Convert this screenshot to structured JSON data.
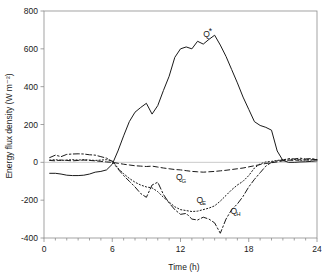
{
  "chart_data": {
    "type": "line",
    "title": "",
    "xlabel": "Time (h)",
    "ylabel": "Energy flux density (W m⁻²)",
    "xlim": [
      0,
      24
    ],
    "ylim": [
      -400,
      800
    ],
    "xticks": [
      0,
      6,
      12,
      18,
      24
    ],
    "yticks": [
      -400,
      -200,
      0,
      200,
      400,
      600,
      800
    ],
    "xtick_labels": [
      "0",
      "6",
      "12",
      "18",
      "24"
    ],
    "ytick_labels": [
      "-400",
      "-200",
      "0",
      "200",
      "400",
      "600",
      "800"
    ],
    "minor_xtick_interval": 1,
    "grid": false,
    "legend_position": "inline-annotations",
    "x": [
      0.5,
      1,
      1.5,
      2,
      2.5,
      3,
      3.5,
      4,
      4.5,
      5,
      5.5,
      6,
      6.5,
      7,
      7.5,
      8,
      8.5,
      9,
      9.5,
      10,
      10.5,
      11,
      11.5,
      12,
      12.5,
      13,
      13.5,
      14,
      14.5,
      15,
      15.5,
      16,
      16.5,
      17,
      17.5,
      18,
      18.5,
      19,
      19.5,
      20,
      20.5,
      21,
      21.5,
      22,
      22.5,
      23,
      23.5,
      24
    ],
    "series": [
      {
        "name": "Q*",
        "label": "Q*",
        "label_base": "Q",
        "label_sub": "*",
        "linestyle": "solid",
        "color": "#1a1a1a",
        "values": [
          -58,
          -58,
          -62,
          -68,
          -70,
          -70,
          -68,
          -62,
          -52,
          -48,
          -40,
          -10,
          60,
          140,
          215,
          265,
          290,
          312,
          255,
          300,
          380,
          455,
          555,
          600,
          610,
          600,
          640,
          625,
          650,
          672,
          620,
          560,
          490,
          420,
          345,
          280,
          215,
          195,
          185,
          170,
          60,
          10,
          0,
          0,
          2,
          3,
          5,
          8
        ]
      },
      {
        "name": "QG",
        "label": "QG",
        "label_base": "Q",
        "label_sub": "G",
        "linestyle": "dashed",
        "color": "#1a1a1a",
        "values": [
          10,
          8,
          12,
          10,
          8,
          10,
          12,
          10,
          8,
          5,
          2,
          0,
          -5,
          -10,
          -14,
          -18,
          -20,
          -22,
          -20,
          -25,
          -30,
          -34,
          -38,
          -40,
          -44,
          -48,
          -50,
          -52,
          -50,
          -48,
          -45,
          -42,
          -38,
          -34,
          -30,
          -24,
          -18,
          -12,
          -6,
          -2,
          2,
          8,
          12,
          10,
          14,
          12,
          14,
          15
        ]
      },
      {
        "name": "QE",
        "label": "QE",
        "label_base": "Q",
        "label_sub": "E",
        "linestyle": "dotted",
        "color": "#1a1a1a",
        "values": [
          12,
          14,
          10,
          12,
          14,
          12,
          14,
          12,
          10,
          12,
          14,
          8,
          -30,
          -60,
          -85,
          -105,
          -120,
          -130,
          -135,
          -155,
          -185,
          -210,
          -235,
          -250,
          -255,
          -260,
          -258,
          -250,
          -242,
          -230,
          -205,
          -175,
          -145,
          -120,
          -100,
          -70,
          -30,
          -8,
          2,
          5,
          10,
          14,
          12,
          16,
          10,
          14,
          12,
          14
        ]
      },
      {
        "name": "QH",
        "label": "QH",
        "label_base": "Q",
        "label_sub": "H",
        "linestyle": "dashdot",
        "color": "#1a1a1a",
        "values": [
          25,
          38,
          30,
          42,
          44,
          45,
          44,
          40,
          38,
          30,
          22,
          5,
          -35,
          -70,
          -100,
          -130,
          -165,
          -185,
          -120,
          -105,
          -170,
          -215,
          -250,
          -275,
          -270,
          -300,
          -305,
          -290,
          -300,
          -320,
          -375,
          -300,
          -250,
          -220,
          -180,
          -130,
          -90,
          -55,
          -20,
          0,
          8,
          12,
          20,
          18,
          22,
          18,
          20,
          15
        ]
      }
    ],
    "annotations": [
      {
        "name": "Q*",
        "base": "Q",
        "sub": "*",
        "x": 14.0,
        "y": 660
      },
      {
        "name": "QG",
        "base": "Q",
        "sub": "G",
        "x": 11.6,
        "y": -95
      },
      {
        "name": "QE",
        "base": "Q",
        "sub": "E",
        "x": 13.4,
        "y": -215
      },
      {
        "name": "QH",
        "base": "Q",
        "sub": "H",
        "x": 16.4,
        "y": -272
      }
    ]
  }
}
